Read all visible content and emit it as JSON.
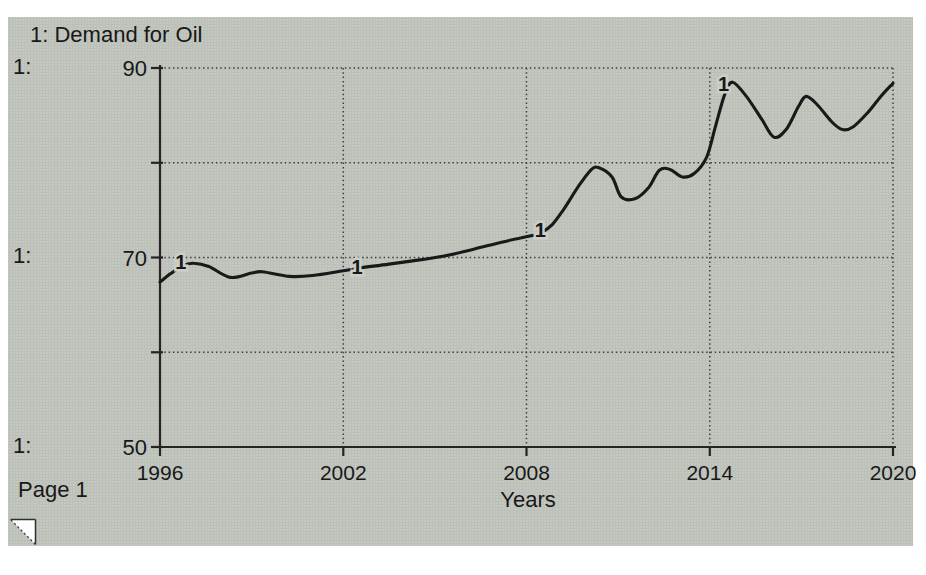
{
  "page": {
    "label": "Page 1"
  },
  "colors": {
    "page_bg": "#ffffff",
    "scan_bg": "#cbcfc8",
    "ink": "#191919",
    "grid": "#3f3f3f",
    "axis": "#242424"
  },
  "icons": {
    "bottom_left": "page-flip-corner-icon"
  },
  "chart_data": {
    "type": "line",
    "title": "1: Demand for Oil",
    "xlabel": "Years",
    "ylabel": "",
    "xlim": [
      1996,
      2020
    ],
    "ylim": [
      50,
      90
    ],
    "grid": "dotted",
    "row_scale_labels": [
      "1:",
      "1:",
      "1:"
    ],
    "x_tick_labels": [
      "1996",
      "2002",
      "2008",
      "2014",
      "2020"
    ],
    "x_tick_years": [
      1996,
      2002,
      2008,
      2014,
      2020
    ],
    "y_tick_labels": [
      "90",
      "70",
      "50"
    ],
    "y_tick_values": [
      90,
      70,
      50
    ],
    "y_grid_values": [
      90,
      80,
      70,
      60
    ],
    "y_axis_tick_values": [
      90,
      80,
      70,
      60,
      50
    ],
    "series": [
      {
        "name": "Demand for Oil",
        "marker_numeral": "1",
        "points": [
          [
            1996.0,
            67.4
          ],
          [
            1996.35,
            68.3
          ],
          [
            1996.75,
            69.15
          ],
          [
            1997.1,
            69.4
          ],
          [
            1997.6,
            69.05
          ],
          [
            1998.3,
            67.9
          ],
          [
            1999.0,
            68.35
          ],
          [
            1999.35,
            68.5
          ],
          [
            2000.25,
            68.0
          ],
          [
            2001.0,
            68.1
          ],
          [
            2002.0,
            68.6
          ],
          [
            2002.55,
            68.9
          ],
          [
            2003.5,
            69.3
          ],
          [
            2004.5,
            69.75
          ],
          [
            2005.3,
            70.15
          ],
          [
            2006.3,
            70.9
          ],
          [
            2007.3,
            71.7
          ],
          [
            2008.3,
            72.4
          ],
          [
            2008.5,
            72.65
          ],
          [
            2008.85,
            73.5
          ],
          [
            2009.2,
            75.0
          ],
          [
            2009.7,
            77.5
          ],
          [
            2010.1,
            79.2
          ],
          [
            2010.35,
            79.5
          ],
          [
            2010.8,
            78.5
          ],
          [
            2011.1,
            76.4
          ],
          [
            2011.55,
            76.2
          ],
          [
            2012.0,
            77.4
          ],
          [
            2012.35,
            79.2
          ],
          [
            2012.7,
            79.3
          ],
          [
            2013.1,
            78.5
          ],
          [
            2013.5,
            78.9
          ],
          [
            2013.9,
            80.6
          ],
          [
            2014.2,
            84.0
          ],
          [
            2014.5,
            87.3
          ],
          [
            2014.75,
            88.5
          ],
          [
            2015.2,
            87.0
          ],
          [
            2015.7,
            84.6
          ],
          [
            2016.1,
            82.7
          ],
          [
            2016.5,
            83.5
          ],
          [
            2016.9,
            85.9
          ],
          [
            2017.15,
            87.0
          ],
          [
            2017.5,
            86.2
          ],
          [
            2018.0,
            84.3
          ],
          [
            2018.35,
            83.5
          ],
          [
            2018.7,
            83.8
          ],
          [
            2019.2,
            85.4
          ],
          [
            2019.6,
            87.0
          ],
          [
            2020.0,
            88.4
          ]
        ]
      }
    ],
    "curve_markers": [
      {
        "numeral": "1",
        "year": 1996.68,
        "value": 69.5
      },
      {
        "numeral": "1",
        "year": 2002.45,
        "value": 69.05
      },
      {
        "numeral": "1",
        "year": 2008.45,
        "value": 72.95
      },
      {
        "numeral": "1",
        "year": 2014.45,
        "value": 88.35
      }
    ]
  }
}
